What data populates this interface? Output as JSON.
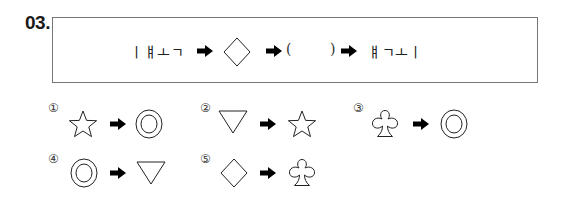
{
  "question": {
    "number": "03.",
    "sequence": {
      "start_text": "ㅣㅒㅗㄱ",
      "step1_shape": "diamond",
      "blank_open": "(",
      "blank_close": ")",
      "end_text": "ㅒㄱㅗㅣ",
      "arrow": "right-arrow"
    }
  },
  "choices": [
    {
      "marker": "①",
      "from": "star",
      "to": "double-circle"
    },
    {
      "marker": "②",
      "from": "down-triangle",
      "to": "star"
    },
    {
      "marker": "③",
      "from": "club",
      "to": "double-circle"
    },
    {
      "marker": "④",
      "from": "double-circle",
      "to": "down-triangle"
    },
    {
      "marker": "⑤",
      "from": "diamond",
      "to": "club"
    }
  ]
}
